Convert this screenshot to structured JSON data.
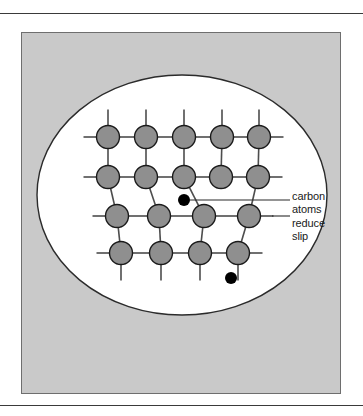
{
  "figure": {
    "caption_lines": [
      "carbon",
      "atoms",
      "reduce",
      "slip"
    ],
    "panel_background_color": "#c9c9c9",
    "oval_fill_color": "#ffffff",
    "oval_stroke_color": "#2b2b2b",
    "metal_atom_color": "#8f8f8f",
    "metal_atom_stroke_color": "#1a1a1a",
    "carbon_atom_color": "#000000",
    "bond_color": "#4d4d4d",
    "oval": {
      "cx": 182,
      "cy": 195,
      "rx": 145,
      "ry": 120
    },
    "metal_atom_radius": 11.5,
    "carbon_atom_radius": 6,
    "metal_atoms": [
      {
        "cx": 108,
        "cy": 137
      },
      {
        "cx": 146,
        "cy": 137
      },
      {
        "cx": 184,
        "cy": 137
      },
      {
        "cx": 222,
        "cy": 137
      },
      {
        "cx": 259,
        "cy": 137
      },
      {
        "cx": 108,
        "cy": 177
      },
      {
        "cx": 146,
        "cy": 177
      },
      {
        "cx": 184,
        "cy": 177
      },
      {
        "cx": 221,
        "cy": 177
      },
      {
        "cx": 258,
        "cy": 177
      },
      {
        "cx": 117,
        "cy": 216
      },
      {
        "cx": 159,
        "cy": 216
      },
      {
        "cx": 204,
        "cy": 216
      },
      {
        "cx": 249,
        "cy": 216
      },
      {
        "cx": 121,
        "cy": 253
      },
      {
        "cx": 161,
        "cy": 253
      },
      {
        "cx": 200,
        "cy": 253
      },
      {
        "cx": 238,
        "cy": 253
      }
    ],
    "carbon_atoms": [
      {
        "cx": 184,
        "cy": 200
      },
      {
        "cx": 231,
        "cy": 278
      }
    ],
    "leader_lines": [
      {
        "x1": 190,
        "y1": 200,
        "x2": 290,
        "y2": 200
      },
      {
        "x1": 272,
        "y1": 216,
        "x2": 290,
        "y2": 216
      }
    ]
  }
}
